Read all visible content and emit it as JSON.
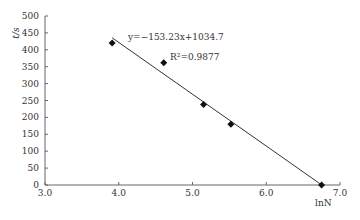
{
  "chart_data": {
    "type": "scatter",
    "title": "",
    "xlabel": "lnN",
    "ylabel": "t/s",
    "xlim": [
      3.0,
      7.0
    ],
    "ylim": [
      0,
      500
    ],
    "x_ticks": [
      "3.0",
      "4.0",
      "5.0",
      "6.0",
      "7.0"
    ],
    "y_ticks": [
      "0",
      "50",
      "100",
      "150",
      "200",
      "250",
      "300",
      "350",
      "400",
      "450",
      "500"
    ],
    "grid": false,
    "series": [
      {
        "name": "data",
        "x": [
          3.91,
          4.61,
          5.15,
          5.52,
          6.75
        ],
        "y": [
          420,
          362,
          238,
          180,
          0
        ],
        "marker": "diamond"
      }
    ],
    "trendline": {
      "slope": -153.23,
      "intercept": 1034.7,
      "x_range": [
        3.91,
        6.75
      ]
    },
    "annotations": [
      "y=−153.23x+1034.7",
      "R²=0.9877"
    ]
  },
  "labels": {
    "equation": "y=−153.23x+1034.7",
    "r2": "R²=0.9877",
    "xlabel": "lnN",
    "ylabel": "t/s"
  }
}
